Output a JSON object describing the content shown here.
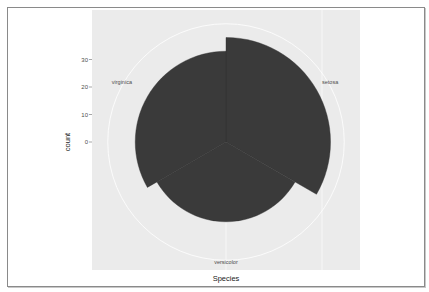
{
  "chart_data": {
    "type": "bar",
    "coord": "polar",
    "title": "",
    "xlabel": "Species",
    "ylabel": "count",
    "categories": [
      "setosa",
      "versicolor",
      "virginica"
    ],
    "values": [
      38,
      29,
      33
    ],
    "yticks": [
      0,
      10,
      20,
      30
    ],
    "ytick_labels": [
      "0",
      "10",
      "20",
      "30"
    ],
    "ylim": [
      0,
      43
    ],
    "grid": true,
    "legend": "none",
    "colors": {
      "bar": "#3a3a3a",
      "panel": "#ebebeb",
      "grid": "#ffffff",
      "text": "#4d4d4d"
    }
  }
}
